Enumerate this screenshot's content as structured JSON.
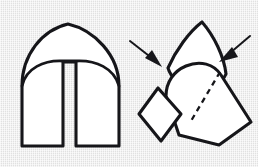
{
  "figure": {
    "title": "Folded shape decomposition diagram",
    "background_color": "#e9e9e9",
    "ink_color": "#16161a",
    "fill_color": "#ffffff",
    "canvas": {
      "width": 258,
      "height": 167
    }
  },
  "parts": {
    "left_assembly": {
      "name": "arch-figure",
      "label": "",
      "outer_arch_apex": {
        "x": 68,
        "y": 24
      },
      "left_edge_x": 22,
      "right_edge_x": 119,
      "base_y": 146,
      "inner_arch_apex": {
        "x": 70,
        "y": 61
      },
      "notch": {
        "left_x": 63,
        "right_x": 76,
        "top_y": 61,
        "bottom_y": 146
      }
    },
    "right_assembly": {
      "name": "exploded-figure",
      "hood": {
        "apex_x": 202,
        "apex_y": 22
      },
      "body": {
        "top_left_x": 172,
        "top_left_y": 80,
        "tilt_degrees": 28
      },
      "fold_line": {
        "from_x": 219,
        "from_y": 72,
        "to_x": 192,
        "to_y": 120,
        "style": "dashed"
      },
      "small_piece": {
        "top": {
          "x": 158,
          "y": 88
        },
        "right": {
          "x": 181,
          "y": 114
        },
        "bottom": {
          "x": 161,
          "y": 141
        },
        "left": {
          "x": 139,
          "y": 114
        }
      }
    }
  },
  "annotations": {
    "arrows": [
      {
        "name": "left-arrow",
        "label": "",
        "direction": "down-right",
        "from": {
          "x": 130,
          "y": 41
        },
        "to": {
          "x": 160,
          "y": 65
        }
      },
      {
        "name": "right-arrow",
        "label": "",
        "direction": "down-left",
        "from": {
          "x": 249,
          "y": 37
        },
        "to": {
          "x": 220,
          "y": 60
        }
      }
    ]
  }
}
